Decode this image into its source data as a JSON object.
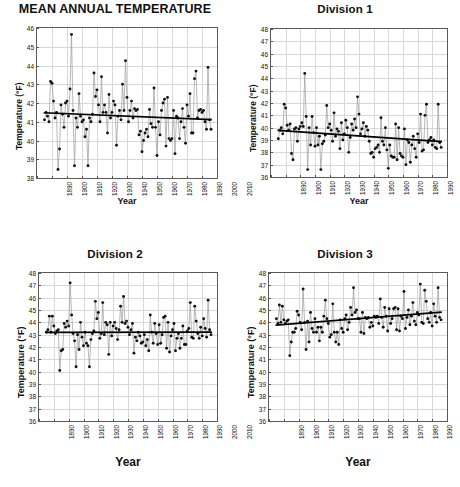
{
  "figure": {
    "axis_title_y": "Temperature (°F)",
    "axis_title_x": "Year",
    "marker_color": "#111111",
    "line_color": "#9a9a9a",
    "trend_color": "#000000",
    "grid_color": "#d8d8d8"
  },
  "chart_data": [
    {
      "type": "line",
      "title": "MEAN ANNUAL TEMPERATURE",
      "xlabel": "Year",
      "ylabel": "Temperature (°F)",
      "xlim": [
        1890,
        2010
      ],
      "ylim": [
        38,
        46
      ],
      "yticks": [
        38,
        39,
        40,
        41,
        42,
        43,
        44,
        45,
        46
      ],
      "xticks": [
        1890,
        1900,
        1910,
        1920,
        1930,
        1940,
        1950,
        1960,
        1970,
        1980,
        1990,
        2000,
        2010
      ],
      "grid": true,
      "legend": "none",
      "trend": {
        "x": [
          1895,
          2006
        ],
        "y": [
          41.48,
          41.12
        ],
        "direction": "slightly decreasing"
      },
      "x": [
        1895,
        1896,
        1897,
        1898,
        1899,
        1900,
        1901,
        1902,
        1903,
        1904,
        1905,
        1906,
        1907,
        1908,
        1909,
        1910,
        1911,
        1912,
        1913,
        1914,
        1915,
        1916,
        1917,
        1918,
        1919,
        1920,
        1921,
        1922,
        1923,
        1924,
        1925,
        1926,
        1927,
        1928,
        1929,
        1930,
        1931,
        1932,
        1933,
        1934,
        1935,
        1936,
        1937,
        1938,
        1939,
        1940,
        1941,
        1942,
        1943,
        1944,
        1945,
        1946,
        1947,
        1948,
        1949,
        1950,
        1951,
        1952,
        1953,
        1954,
        1955,
        1956,
        1957,
        1958,
        1959,
        1960,
        1961,
        1962,
        1963,
        1964,
        1965,
        1966,
        1967,
        1968,
        1969,
        1970,
        1971,
        1972,
        1973,
        1974,
        1975,
        1976,
        1977,
        1978,
        1979,
        1980,
        1981,
        1982,
        1983,
        1984,
        1985,
        1986,
        1987,
        1988,
        1989,
        1990,
        1991,
        1992,
        1993,
        1994,
        1995,
        1996,
        1997,
        1998,
        1999,
        2000,
        2001,
        2002,
        2003,
        2004,
        2005,
        2006
      ],
      "values": [
        41.1,
        41.5,
        41.3,
        41.0,
        43.15,
        43.05,
        42.1,
        41.2,
        41.5,
        38.45,
        39.55,
        41.9,
        41.4,
        40.7,
        42.0,
        42.1,
        41.3,
        42.75,
        45.65,
        41.6,
        38.65,
        41.2,
        40.7,
        42.5,
        41.3,
        41.0,
        41.1,
        40.2,
        40.6,
        38.65,
        41.2,
        41.0,
        41.4,
        43.6,
        42.35,
        42.7,
        41.9,
        41.0,
        43.4,
        41.5,
        41.9,
        41.5,
        40.4,
        42.45,
        41.2,
        41.5,
        42.1,
        41.9,
        39.75,
        41.3,
        41.6,
        41.1,
        43.0,
        41.6,
        44.25,
        42.3,
        41.0,
        41.6,
        42.1,
        41.2,
        41.7,
        41.6,
        41.65,
        40.3,
        40.5,
        39.4,
        40.0,
        40.4,
        40.6,
        40.2,
        41.65,
        40.9,
        40.7,
        42.8,
        40.7,
        39.2,
        41.0,
        40.3,
        41.6,
        42.0,
        42.2,
        39.7,
        42.3,
        40.1,
        40.0,
        40.1,
        41.6,
        39.3,
        41.3,
        41.2,
        40.1,
        41.0,
        41.7,
        40.7,
        39.85,
        41.9,
        41.3,
        42.5,
        40.4,
        40.4,
        43.3,
        43.7,
        41.2,
        41.6,
        41.65,
        41.5,
        41.6,
        41.0,
        40.6,
        43.9,
        41.1,
        40.6
      ]
    },
    {
      "type": "line",
      "title": "Division 1",
      "xlabel": "Year",
      "ylabel": "Temperature (°F)",
      "xlim": [
        1890,
        2010
      ],
      "ylim": [
        36,
        48
      ],
      "yticks": [
        36,
        37,
        38,
        39,
        40,
        41,
        42,
        43,
        44,
        45,
        46,
        47,
        48
      ],
      "xticks": [
        1890,
        1900,
        1910,
        1920,
        1930,
        1940,
        1950,
        1960,
        1970,
        1980,
        1990,
        2000,
        2010
      ],
      "grid": true,
      "legend": "none",
      "trend": {
        "x": [
          1895,
          2006
        ],
        "y": [
          39.78,
          38.88
        ],
        "direction": "decreasing"
      },
      "x": [
        1895,
        1896,
        1897,
        1898,
        1899,
        1900,
        1901,
        1902,
        1903,
        1904,
        1905,
        1906,
        1907,
        1908,
        1909,
        1910,
        1911,
        1912,
        1913,
        1914,
        1915,
        1916,
        1917,
        1918,
        1919,
        1920,
        1921,
        1922,
        1923,
        1924,
        1925,
        1926,
        1927,
        1928,
        1929,
        1930,
        1931,
        1932,
        1933,
        1934,
        1935,
        1936,
        1937,
        1938,
        1939,
        1940,
        1941,
        1942,
        1943,
        1944,
        1945,
        1946,
        1947,
        1948,
        1949,
        1950,
        1951,
        1952,
        1953,
        1954,
        1955,
        1956,
        1957,
        1958,
        1959,
        1960,
        1961,
        1962,
        1963,
        1964,
        1965,
        1966,
        1967,
        1968,
        1969,
        1970,
        1971,
        1972,
        1973,
        1974,
        1975,
        1976,
        1977,
        1978,
        1979,
        1980,
        1981,
        1982,
        1983,
        1984,
        1985,
        1986,
        1987,
        1988,
        1989,
        1990,
        1991,
        1992,
        1993,
        1994,
        1995,
        1996,
        1997,
        1998,
        1999,
        2000,
        2001,
        2002,
        2003,
        2004,
        2005,
        2006
      ],
      "values": [
        39.1,
        39.8,
        40.0,
        39.5,
        41.9,
        41.6,
        40.2,
        39.8,
        40.3,
        37.9,
        37.4,
        39.9,
        40.0,
        38.9,
        39.9,
        40.1,
        40.4,
        40.1,
        44.4,
        40.9,
        36.6,
        40.0,
        38.6,
        40.9,
        39.6,
        38.5,
        40.0,
        38.6,
        39.3,
        36.6,
        38.7,
        38.9,
        39.4,
        41.8,
        40.0,
        40.3,
        39.8,
        38.9,
        41.2,
        39.3,
        39.9,
        39.7,
        38.3,
        40.4,
        39.0,
        39.5,
        40.6,
        40.0,
        38.0,
        39.2,
        40.3,
        39.8,
        40.7,
        40.0,
        42.5,
        41.1,
        39.5,
        39.9,
        40.4,
        39.3,
        40.1,
        39.8,
        38.9,
        37.9,
        38.0,
        37.6,
        38.3,
        38.4,
        38.6,
        38.0,
        40.8,
        38.9,
        38.6,
        40.0,
        38.2,
        36.7,
        38.6,
        37.7,
        37.6,
        37.6,
        40.3,
        37.4,
        40.0,
        37.9,
        37.7,
        37.6,
        39.9,
        37.0,
        39.0,
        38.8,
        37.2,
        38.6,
        39.3,
        38.3,
        37.6,
        39.5,
        38.8,
        41.1,
        38.1,
        38.2,
        41.0,
        41.9,
        38.8,
        39.0,
        39.2,
        38.6,
        39.0,
        38.4,
        38.3,
        41.9,
        38.8,
        38.4
      ]
    },
    {
      "type": "line",
      "title": "Division 2",
      "xlabel": "Year",
      "ylabel": "Temperature (°F)",
      "xlim": [
        1890,
        2010
      ],
      "ylim": [
        36,
        48
      ],
      "yticks": [
        36,
        37,
        38,
        39,
        40,
        41,
        42,
        43,
        44,
        45,
        46,
        47,
        48
      ],
      "xticks": [
        1890,
        1900,
        1910,
        1920,
        1930,
        1940,
        1950,
        1960,
        1970,
        1980,
        1990,
        2000,
        2010
      ],
      "grid": true,
      "legend": "none",
      "trend": {
        "x": [
          1895,
          2006
        ],
        "y": [
          43.18,
          43.2
        ],
        "direction": "flat"
      },
      "x": [
        1895,
        1896,
        1897,
        1898,
        1899,
        1900,
        1901,
        1902,
        1903,
        1904,
        1905,
        1906,
        1907,
        1908,
        1909,
        1910,
        1911,
        1912,
        1913,
        1914,
        1915,
        1916,
        1917,
        1918,
        1919,
        1920,
        1921,
        1922,
        1923,
        1924,
        1925,
        1926,
        1927,
        1928,
        1929,
        1930,
        1931,
        1932,
        1933,
        1934,
        1935,
        1936,
        1937,
        1938,
        1939,
        1940,
        1941,
        1942,
        1943,
        1944,
        1945,
        1946,
        1947,
        1948,
        1949,
        1950,
        1951,
        1952,
        1953,
        1954,
        1955,
        1956,
        1957,
        1958,
        1959,
        1960,
        1961,
        1962,
        1963,
        1964,
        1965,
        1966,
        1967,
        1968,
        1969,
        1970,
        1971,
        1972,
        1973,
        1974,
        1975,
        1976,
        1977,
        1978,
        1979,
        1980,
        1981,
        1982,
        1983,
        1984,
        1985,
        1986,
        1987,
        1988,
        1989,
        1990,
        1991,
        1992,
        1993,
        1994,
        1995,
        1996,
        1997,
        1998,
        1999,
        2000,
        2001,
        2002,
        2003,
        2004,
        2005,
        2006
      ],
      "values": [
        43.2,
        43.4,
        44.5,
        43.2,
        44.5,
        43.7,
        43.1,
        43.3,
        43.4,
        40.1,
        41.7,
        41.8,
        43.9,
        43.6,
        44.1,
        43.7,
        47.2,
        44.6,
        43.1,
        42.5,
        40.4,
        43.0,
        41.8,
        44.0,
        42.8,
        42.1,
        43.2,
        42.3,
        42.1,
        40.4,
        42.6,
        43.1,
        43.3,
        45.7,
        44.3,
        44.8,
        42.7,
        43.1,
        45.6,
        43.0,
        44.0,
        43.8,
        41.4,
        44.0,
        42.9,
        43.7,
        44.0,
        43.5,
        42.6,
        43.4,
        45.3,
        44.0,
        46.1,
        43.9,
        44.1,
        43.6,
        43.0,
        43.4,
        43.9,
        41.5,
        42.8,
        42.5,
        43.2,
        42.9,
        42.3,
        42.4,
        43.0,
        42.1,
        42.6,
        41.7,
        44.6,
        43.2,
        42.3,
        43.9,
        43.1,
        42.2,
        43.8,
        42.3,
        43.0,
        44.4,
        44.5,
        41.9,
        44.0,
        41.6,
        42.9,
        43.4,
        43.9,
        41.7,
        42.7,
        43.1,
        41.9,
        42.7,
        43.7,
        42.2,
        42.2,
        43.3,
        43.5,
        45.6,
        42.8,
        42.7,
        45.3,
        44.1,
        43.1,
        42.7,
        43.6,
        42.9,
        44.3,
        43.5,
        42.8,
        45.8,
        43.4,
        43.0
      ]
    },
    {
      "type": "line",
      "title": "Division 3",
      "xlabel": "Year",
      "ylabel": "Temperature (°F)",
      "xlim": [
        1890,
        2010
      ],
      "ylim": [
        36,
        48
      ],
      "yticks": [
        36,
        37,
        38,
        39,
        40,
        41,
        42,
        43,
        44,
        45,
        46,
        47,
        48
      ],
      "xticks": [
        1890,
        1900,
        1910,
        1920,
        1930,
        1940,
        1950,
        1960,
        1970,
        1980,
        1990,
        2000,
        2010
      ],
      "grid": true,
      "legend": "none",
      "trend": {
        "x": [
          1895,
          2006
        ],
        "y": [
          43.78,
          44.82
        ],
        "direction": "increasing"
      },
      "x": [
        1895,
        1896,
        1897,
        1898,
        1899,
        1900,
        1901,
        1902,
        1903,
        1904,
        1905,
        1906,
        1907,
        1908,
        1909,
        1910,
        1911,
        1912,
        1913,
        1914,
        1915,
        1916,
        1917,
        1918,
        1919,
        1920,
        1921,
        1922,
        1923,
        1924,
        1925,
        1926,
        1927,
        1928,
        1929,
        1930,
        1931,
        1932,
        1933,
        1934,
        1935,
        1936,
        1937,
        1938,
        1939,
        1940,
        1941,
        1942,
        1943,
        1944,
        1945,
        1946,
        1947,
        1948,
        1949,
        1950,
        1951,
        1952,
        1953,
        1954,
        1955,
        1956,
        1957,
        1958,
        1959,
        1960,
        1961,
        1962,
        1963,
        1964,
        1965,
        1966,
        1967,
        1968,
        1969,
        1970,
        1971,
        1972,
        1973,
        1974,
        1975,
        1976,
        1977,
        1978,
        1979,
        1980,
        1981,
        1982,
        1983,
        1984,
        1985,
        1986,
        1987,
        1988,
        1989,
        1990,
        1991,
        1992,
        1993,
        1994,
        1995,
        1996,
        1997,
        1998,
        1999,
        2000,
        2001,
        2002,
        2003,
        2004,
        2005,
        2006
      ],
      "values": [
        44.3,
        43.9,
        45.4,
        44.0,
        45.3,
        44.2,
        43.9,
        44.1,
        44.2,
        41.3,
        42.4,
        43.2,
        43.2,
        43.5,
        44.9,
        44.6,
        44.0,
        43.4,
        46.7,
        44.0,
        41.8,
        44.1,
        42.4,
        44.8,
        43.5,
        43.2,
        44.3,
        43.2,
        43.6,
        42.5,
        43.6,
        43.2,
        44.5,
        45.8,
        44.3,
        43.9,
        42.8,
        43.0,
        45.5,
        43.2,
        42.4,
        43.2,
        42.2,
        44.2,
        43.5,
        43.2,
        44.3,
        44.6,
        43.4,
        44.0,
        45.2,
        44.6,
        46.8,
        44.8,
        45.0,
        44.3,
        44.3,
        43.2,
        44.8,
        43.1,
        44.4,
        44.3,
        44.4,
        43.6,
        44.0,
        43.7,
        44.5,
        44.4,
        44.5,
        43.9,
        45.9,
        44.4,
        43.6,
        45.2,
        44.5,
        43.3,
        45.1,
        43.9,
        44.3,
        45.1,
        45.2,
        43.4,
        45.1,
        43.3,
        44.5,
        44.3,
        46.5,
        43.5,
        44.4,
        45.0,
        43.8,
        44.5,
        45.6,
        44.1,
        43.8,
        44.8,
        44.6,
        47.1,
        44.0,
        43.9,
        46.6,
        45.7,
        44.3,
        44.0,
        44.8,
        43.7,
        45.5,
        44.5,
        44.0,
        46.8,
        44.4,
        44.2
      ]
    }
  ]
}
